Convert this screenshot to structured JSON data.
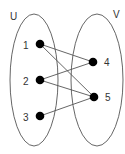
{
  "diagram": {
    "type": "bipartite-graph",
    "sets": [
      {
        "id": "U",
        "label": "U",
        "cx": 34,
        "cy": 80,
        "rx": 24,
        "ry": 66,
        "label_x": 10,
        "label_y": 20
      },
      {
        "id": "V",
        "label": "V",
        "cx": 97,
        "cy": 80,
        "rx": 26,
        "ry": 66,
        "label_x": 113,
        "label_y": 18
      }
    ],
    "nodes": [
      {
        "id": "1",
        "label": "1",
        "set": "U",
        "x": 40,
        "y": 44,
        "label_x": 23,
        "label_y": 49
      },
      {
        "id": "2",
        "label": "2",
        "set": "U",
        "x": 40,
        "y": 80,
        "label_x": 23,
        "label_y": 85
      },
      {
        "id": "3",
        "label": "3",
        "set": "U",
        "x": 40,
        "y": 116,
        "label_x": 23,
        "label_y": 121
      },
      {
        "id": "4",
        "label": "4",
        "set": "V",
        "x": 93,
        "y": 62,
        "label_x": 104,
        "label_y": 66
      },
      {
        "id": "5",
        "label": "5",
        "set": "V",
        "x": 94,
        "y": 97,
        "label_x": 105,
        "label_y": 101
      }
    ],
    "edges": [
      {
        "from": "1",
        "to": "4"
      },
      {
        "from": "1",
        "to": "5"
      },
      {
        "from": "2",
        "to": "4"
      },
      {
        "from": "2",
        "to": "5"
      },
      {
        "from": "3",
        "to": "5"
      }
    ],
    "colors": {
      "stroke": "#555555",
      "node_fill": "#000000",
      "text": "#333333",
      "background": "#ffffff"
    }
  }
}
